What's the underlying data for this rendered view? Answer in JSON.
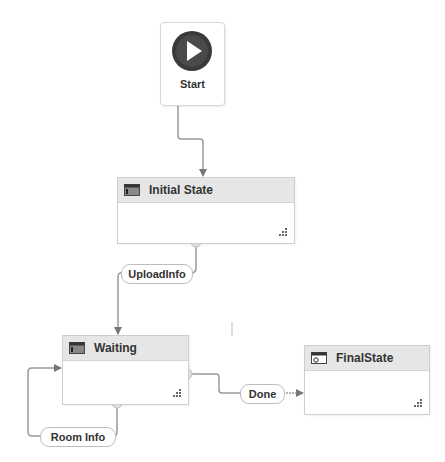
{
  "diagram": {
    "type": "state-machine",
    "start": {
      "label": "Start",
      "icon": "play-icon"
    },
    "states": [
      {
        "id": "initial",
        "label": "Initial State",
        "icon": "state-icon"
      },
      {
        "id": "waiting",
        "label": "Waiting",
        "icon": "state-icon"
      },
      {
        "id": "final",
        "label": "FinalState",
        "icon": "final-state-icon"
      }
    ],
    "transitions": [
      {
        "from": "Start",
        "to": "Initial State",
        "label": ""
      },
      {
        "from": "Initial State",
        "to": "Waiting",
        "label": "UploadInfo"
      },
      {
        "from": "Waiting",
        "to": "Waiting",
        "label": "Room Info"
      },
      {
        "from": "Waiting",
        "to": "FinalState",
        "label": "Done"
      }
    ]
  }
}
